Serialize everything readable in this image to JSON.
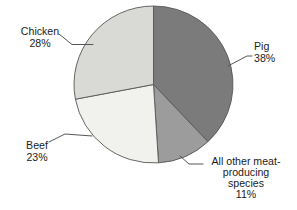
{
  "figure": {
    "background": "#ffffff",
    "text_color": "#1b1b1b"
  },
  "chart_data": {
    "type": "pie",
    "title": "",
    "start_angle_deg": 0,
    "direction": "clockwise",
    "legend_position": "none",
    "labels_style": "outside-with-leader-lines",
    "stroke_color": "#565656",
    "slices": [
      {
        "id": "pig",
        "label": "Pig",
        "value_pct": 38,
        "color": "#7b7b7b",
        "label_lines": [
          "Pig",
          "38%"
        ]
      },
      {
        "id": "other",
        "label": "All other meat-producing species",
        "value_pct": 11,
        "color": "#9c9c9c",
        "label_lines": [
          "All other meat-",
          "producing",
          "species",
          "11%"
        ]
      },
      {
        "id": "beef",
        "label": "Beef",
        "value_pct": 23,
        "color": "#f1f1ee",
        "label_lines": [
          "Beef",
          "23%"
        ]
      },
      {
        "id": "chicken",
        "label": "Chicken",
        "value_pct": 28,
        "color": "#d9d9d6",
        "label_lines": [
          "Chicken",
          "28%"
        ]
      }
    ],
    "layout": {
      "center": [
        153.5,
        84.5
      ],
      "radius": [
        79.5,
        78.5
      ],
      "labels": {
        "pig": {
          "x": 254,
          "y": 50,
          "anchor": "start",
          "line_height": 12
        },
        "other": {
          "x": 246,
          "y": 165,
          "anchor": "middle",
          "line_height": 11
        },
        "beef": {
          "x": 37,
          "y": 149,
          "anchor": "middle",
          "line_height": 12
        },
        "chicken": {
          "x": 40,
          "y": 35,
          "anchor": "middle",
          "line_height": 12
        }
      },
      "leaders": {
        "pig": [
          [
            228,
            66
          ],
          [
            247,
            56
          ],
          [
            252,
            56
          ]
        ],
        "other": [
          [
            180,
            156
          ],
          [
            189,
            164
          ],
          [
            203,
            164
          ]
        ],
        "beef": [
          [
            49,
            142
          ],
          [
            65,
            134
          ],
          [
            92,
            136
          ]
        ],
        "chicken": [
          [
            59,
            34
          ],
          [
            72,
            44.5
          ],
          [
            93,
            44.5
          ]
        ]
      }
    }
  }
}
